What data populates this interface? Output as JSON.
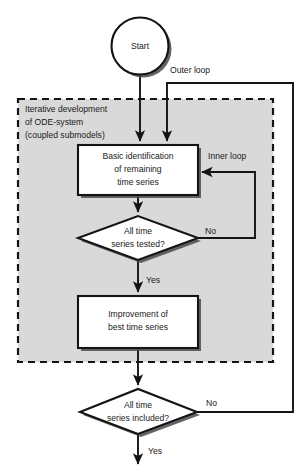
{
  "diagram": {
    "title_region": "ODE-system identification flowchart",
    "canvas": {
      "width": 308,
      "height": 476,
      "background": "#ffffff"
    },
    "colors": {
      "stroke": "#141414",
      "shape_fill": "#ffffff",
      "group_fill": "#d9d9d9",
      "shadow": "#4a4a4a",
      "text": "#1a1a1a"
    },
    "group": {
      "name": "iterative-development-group",
      "style": "dashed",
      "label_lines": [
        "Iterative development",
        "of ODE-system",
        "(coupled submodels)"
      ]
    },
    "nodes": [
      {
        "id": "start",
        "type": "terminator",
        "label": "Start"
      },
      {
        "id": "basic-identification",
        "type": "process",
        "label_lines": [
          "Basic identification",
          "of remaining",
          "time series"
        ]
      },
      {
        "id": "all-time-series-tested",
        "type": "decision",
        "label_lines": [
          "All  time",
          "series  tested?"
        ]
      },
      {
        "id": "improvement-best-time-series",
        "type": "process",
        "label_lines": [
          "Improvement of",
          "best time series"
        ]
      },
      {
        "id": "all-time-series-included",
        "type": "decision",
        "label_lines": [
          "All time",
          "series included?"
        ]
      }
    ],
    "edge_labels": {
      "outer_loop": "Outer loop",
      "inner_loop": "Inner loop",
      "tested_no": "No",
      "tested_yes": "Yes",
      "included_no": "No",
      "included_yes": "Yes"
    }
  }
}
